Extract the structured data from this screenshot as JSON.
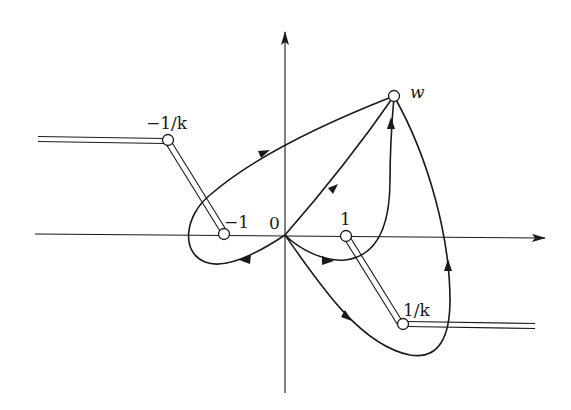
{
  "diagram": {
    "type": "complex-plane paths with branch cuts",
    "axes": {
      "origin_label": "0"
    },
    "points": {
      "minus_one": "−1",
      "one": "1",
      "minus_one_over_k": "−1/k",
      "one_over_k": "1/k",
      "w": "w"
    },
    "colors": {
      "stroke": "#1a1a1a",
      "background": "#ffffff"
    }
  }
}
